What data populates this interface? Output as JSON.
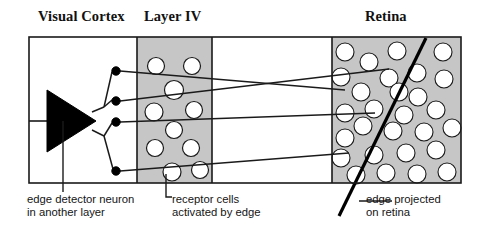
{
  "diagram": {
    "title_labels": [
      {
        "id": "visual-cortex",
        "text": "Visual Cortex"
      },
      {
        "id": "layer-iv",
        "text": "Layer IV"
      },
      {
        "id": "retina",
        "text": "Retina"
      }
    ],
    "captions": [
      {
        "id": "edge-detector-neuron",
        "line1": "edge detector neuron",
        "line2": "in another layer"
      },
      {
        "id": "receptor-cells",
        "line1": "receptor cells",
        "line2": "activated by edge"
      },
      {
        "id": "edge-projected",
        "line1": "edge projected",
        "line2": "on retina"
      }
    ],
    "colors": {
      "panel_fill_gray": "#c6c6c6",
      "panel_fill_white": "#ffffff",
      "stroke": "#1a1a1a",
      "cell_fill": "#ffffff",
      "neuron_fill": "#000000",
      "edge_line": "#000000",
      "text": "#141414"
    },
    "frame": {
      "x": 29,
      "y": 37,
      "width": 432,
      "height": 146
    },
    "panels": [
      {
        "id": "visual-cortex-panel",
        "x": 29,
        "y": 37,
        "width": 108,
        "height": 146,
        "fill": "#ffffff"
      },
      {
        "id": "layer-iv-panel",
        "x": 137,
        "y": 37,
        "width": 75,
        "height": 146,
        "fill": "#c6c6c6"
      },
      {
        "id": "relay-panel",
        "x": 212,
        "y": 37,
        "width": 120,
        "height": 146,
        "fill": "#ffffff"
      },
      {
        "id": "retina-panel",
        "x": 332,
        "y": 37,
        "width": 129,
        "height": 146,
        "fill": "#c6c6c6"
      }
    ],
    "neuron": {
      "id": "edge-detector-neuron-triangle",
      "points": "47,90 47,152 96,121",
      "axon": {
        "x1": 29,
        "y1": 121,
        "x2": 47,
        "y2": 121
      }
    },
    "synapses": [
      {
        "cx": 116,
        "cy": 71,
        "r": 4.2
      },
      {
        "cx": 116,
        "cy": 101,
        "r": 4.2
      },
      {
        "cx": 116,
        "cy": 122,
        "r": 4.2
      },
      {
        "cx": 116,
        "cy": 171,
        "r": 4.2
      }
    ],
    "dendrites": [
      "M96,110 L104,106 L112,71",
      "M96,110 L104,106 L112,101",
      "M96,131 L104,135 L112,122",
      "M96,131 L104,135 L112,171"
    ],
    "projection_lines": [
      {
        "id": "projection-1",
        "x1": 120,
        "y1": 71,
        "x2": 345,
        "y2": 90
      },
      {
        "id": "projection-2",
        "x1": 120,
        "y1": 101,
        "x2": 389,
        "y2": 69
      },
      {
        "id": "projection-3",
        "x1": 120,
        "y1": 122,
        "x2": 375,
        "y2": 113
      },
      {
        "id": "projection-4",
        "x1": 120,
        "y1": 171,
        "x2": 349,
        "y2": 153
      }
    ],
    "layer_iv_cells": [
      {
        "cx": 156,
        "cy": 66,
        "r": 8.5,
        "activated": false
      },
      {
        "cx": 192,
        "cy": 66,
        "r": 8.5,
        "activated": false
      },
      {
        "cx": 174,
        "cy": 90,
        "r": 9.5,
        "activated": true
      },
      {
        "cx": 154,
        "cy": 112,
        "r": 9.0,
        "activated": true
      },
      {
        "cx": 194,
        "cy": 110,
        "r": 8.5,
        "activated": false
      },
      {
        "cx": 174,
        "cy": 130,
        "r": 8.5,
        "activated": true
      },
      {
        "cx": 155,
        "cy": 148,
        "r": 8.5,
        "activated": false
      },
      {
        "cx": 191,
        "cy": 148,
        "r": 8.5,
        "activated": false
      },
      {
        "cx": 172,
        "cy": 172,
        "r": 9.0,
        "activated": true
      },
      {
        "cx": 200,
        "cy": 170,
        "r": 8.5,
        "activated": false
      }
    ],
    "retina_cells": [
      {
        "cx": 345,
        "cy": 52,
        "r": 9.0
      },
      {
        "cx": 369,
        "cy": 62,
        "r": 9.0
      },
      {
        "cx": 397,
        "cy": 51,
        "r": 9.0
      },
      {
        "cx": 443,
        "cy": 52,
        "r": 9.0
      },
      {
        "cx": 341,
        "cy": 77,
        "r": 9.0
      },
      {
        "cx": 389,
        "cy": 78,
        "r": 9.0
      },
      {
        "cx": 417,
        "cy": 73,
        "r": 9.0
      },
      {
        "cx": 444,
        "cy": 79,
        "r": 9.0
      },
      {
        "cx": 361,
        "cy": 92,
        "r": 9.0
      },
      {
        "cx": 418,
        "cy": 97,
        "r": 9.0
      },
      {
        "cx": 345,
        "cy": 113,
        "r": 9.0
      },
      {
        "cx": 374,
        "cy": 109,
        "r": 9.0
      },
      {
        "cx": 404,
        "cy": 115,
        "r": 9.0
      },
      {
        "cx": 436,
        "cy": 110,
        "r": 9.0
      },
      {
        "cx": 363,
        "cy": 126,
        "r": 9.0
      },
      {
        "cx": 393,
        "cy": 131,
        "r": 9.0
      },
      {
        "cx": 424,
        "cy": 132,
        "r": 9.0
      },
      {
        "cx": 345,
        "cy": 138,
        "r": 9.0
      },
      {
        "cx": 452,
        "cy": 128,
        "r": 9.0
      },
      {
        "cx": 341,
        "cy": 158,
        "r": 9.0
      },
      {
        "cx": 374,
        "cy": 155,
        "r": 9.0
      },
      {
        "cx": 406,
        "cy": 153,
        "r": 9.0
      },
      {
        "cx": 436,
        "cy": 150,
        "r": 9.0
      },
      {
        "cx": 356,
        "cy": 175,
        "r": 9.0
      },
      {
        "cx": 386,
        "cy": 173,
        "r": 9.0
      },
      {
        "cx": 417,
        "cy": 174,
        "r": 9.0
      },
      {
        "cx": 447,
        "cy": 172,
        "r": 9.0
      },
      {
        "cx": 376,
        "cy": 93,
        "r": 9.0
      },
      {
        "cx": 340,
        "cy": 97,
        "r": 9.0
      },
      {
        "cx": 399,
        "cy": 92,
        "r": 9.0
      }
    ],
    "edge_line": {
      "x1": 426,
      "y1": 38,
      "x2": 339,
      "y2": 216,
      "stroke_width": 3.2
    },
    "leaders": [
      {
        "id": "leader-neuron",
        "d": "M63,183 L63,191"
      },
      {
        "id": "leader-receptor",
        "d": "M166,183 L166,197 L172,197"
      },
      {
        "id": "leader-edge",
        "d": "M359,200 L393,200"
      }
    ]
  }
}
